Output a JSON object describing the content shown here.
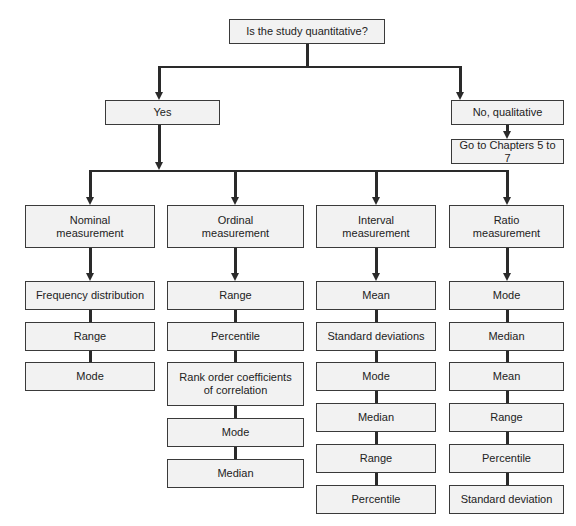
{
  "root": {
    "label": "Is the study quantitative?"
  },
  "branches": {
    "yes": {
      "label": "Yes"
    },
    "no": {
      "label": "No, qualitative",
      "next": "Go to Chapters 5 to 7"
    }
  },
  "measurements": [
    {
      "label": "Nominal measurement",
      "line1": "Nominal",
      "line2": "measurement",
      "items": [
        "Frequency distribution",
        "Range",
        "Mode"
      ]
    },
    {
      "label": "Ordinal measurement",
      "line1": "Ordinal",
      "line2": "measurement",
      "items": [
        "Range",
        "Percentile",
        "Rank order coefficients of correlation",
        "Mode",
        "Median"
      ],
      "rank_line1": "Rank order coefficients",
      "rank_line2": "of correlation"
    },
    {
      "label": "Interval measurement",
      "line1": "Interval",
      "line2": "measurement",
      "items": [
        "Mean",
        "Standard deviations",
        "Mode",
        "Median",
        "Range",
        "Percentile"
      ]
    },
    {
      "label": "Ratio measurement",
      "line1": "Ratio",
      "line2": "measurement",
      "items": [
        "Mode",
        "Median",
        "Mean",
        "Range",
        "Percentile",
        "Standard deviation"
      ]
    }
  ],
  "colors": {
    "box_fill": "#f2f2f2",
    "border": "#3a3a3a",
    "connector": "#2a2a2a"
  }
}
